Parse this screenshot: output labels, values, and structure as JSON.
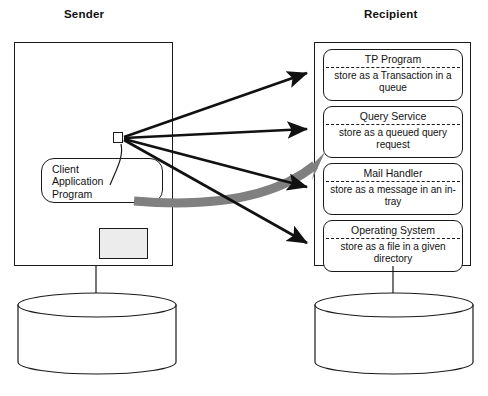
{
  "diagram": {
    "sender": {
      "title": "Sender",
      "client_application": {
        "label": "Client\nApplication\nProgram",
        "port_name": "port"
      },
      "secondary_box": {
        "label": "",
        "fill_color": "#ececec"
      },
      "datastore": {
        "label": ""
      }
    },
    "recipient": {
      "title": "Recipient",
      "services": [
        {
          "name": "TP Program",
          "action": "store as a Transaction\nin a queue"
        },
        {
          "name": "Query Service",
          "action": "store as a queued\nquery request"
        },
        {
          "name": "Mail Handler",
          "action": "store as a message\nin an in-tray"
        },
        {
          "name": "Operating System",
          "action": "store as a file in a\ngiven directory"
        }
      ],
      "datastore": {
        "label": ""
      }
    },
    "connectors": {
      "black_arrow_count": 4,
      "gray_arrow_count": 1
    },
    "colors": {
      "line": "#1a1a1a",
      "gray_arrow": "#808080",
      "box_fill": "#ffffff",
      "gray_box_fill": "#ececec"
    },
    "caption": ""
  }
}
